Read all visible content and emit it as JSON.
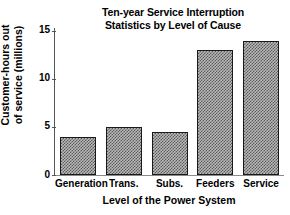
{
  "chart_data": {
    "type": "bar",
    "title": "Ten-year Service Interruption Statistics by Level of Cause",
    "title_lines": [
      "Ten-year Service Interruption",
      "Statistics by Level of Cause"
    ],
    "xlabel": "Level of the Power System",
    "ylabel": "Customer-hours out of service (millions)",
    "ylabel_lines": [
      "Customer-hours out",
      "of service (millions)"
    ],
    "categories": [
      "Generation",
      "Trans.",
      "Subs.",
      "Feeders",
      "Service"
    ],
    "values": [
      4.0,
      5.0,
      4.5,
      13.0,
      14.0
    ],
    "yticks": [
      0,
      5,
      10,
      15
    ],
    "ytick_labels": [
      "0",
      "5",
      "10",
      "15"
    ],
    "ylim": [
      0,
      15.3
    ],
    "grid": false,
    "legend": null,
    "bar_fill": "#b9b9b9",
    "bar_hatch": "checkerboard-dither",
    "bar_edge_color": "#1a1a1a",
    "axis_color": "#555555",
    "background": "#ffffff",
    "text_color": "#000000"
  }
}
